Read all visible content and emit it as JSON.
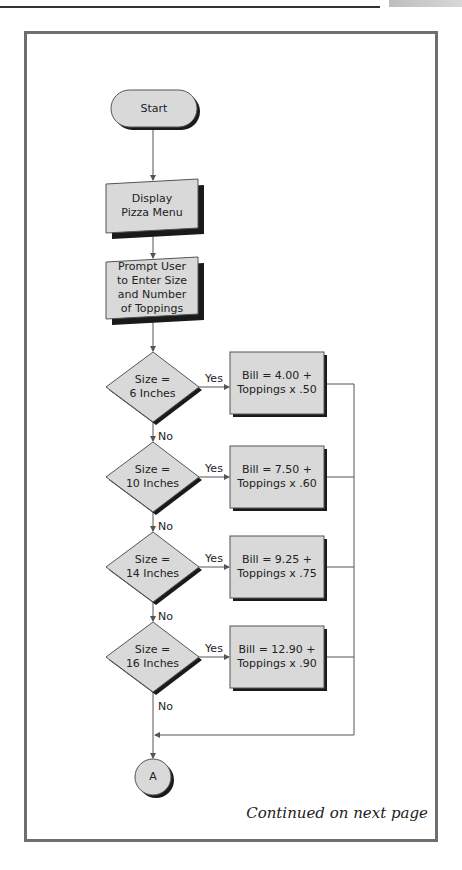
{
  "header": {
    "page_tab_visible": true
  },
  "flowchart": {
    "title": "Pizza ordering flowchart",
    "start": {
      "label": "Start"
    },
    "display": {
      "label_line1": "Display",
      "label_line2": "Pizza Menu"
    },
    "prompt": {
      "label_line1": "Prompt User",
      "label_line2": "to Enter Size",
      "label_line3": "and Number",
      "label_line4": "of Toppings"
    },
    "decisions": [
      {
        "line1": "Size =",
        "line2": "6 Inches",
        "yes": "Yes",
        "no": "No",
        "bill_line1": "Bill = 4.00 +",
        "bill_line2": "Toppings x .50"
      },
      {
        "line1": "Size =",
        "line2": "10 Inches",
        "yes": "Yes",
        "no": "No",
        "bill_line1": "Bill = 7.50 +",
        "bill_line2": "Toppings x .60"
      },
      {
        "line1": "Size =",
        "line2": "14 Inches",
        "yes": "Yes",
        "no": "No",
        "bill_line1": "Bill = 9.25 +",
        "bill_line2": "Toppings x .75"
      },
      {
        "line1": "Size =",
        "line2": "16 Inches",
        "yes": "Yes",
        "no": "No",
        "bill_line1": "Bill = 12.90 +",
        "bill_line2": "Toppings x .90"
      }
    ],
    "connector": {
      "label": "A"
    },
    "continued": "Continued on next page"
  },
  "colors": {
    "shape_fill": "#d9d9d9",
    "shadow": "#1a1a1a",
    "frame": "#6e6e6e",
    "line": "#555555"
  }
}
